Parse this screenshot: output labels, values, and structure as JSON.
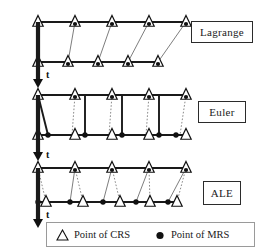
{
  "figure": {
    "title_hidden": "",
    "panels": [
      {
        "id": "lagrange",
        "label": "Lagrange",
        "time_axis_label": "t",
        "description": "Mesh points coincide with material points at all times",
        "rows": [
          {
            "name": "row-initial",
            "y": 22,
            "crs_x": [
              38,
              75,
              112,
              149,
              186
            ],
            "mrs_x": [
              38,
              75,
              112,
              149,
              186
            ],
            "coincident": true
          },
          {
            "name": "row-deformed",
            "y": 62,
            "crs_x": [
              38,
              68,
              98,
              128,
              158
            ],
            "mrs_x": [
              38,
              68,
              98,
              128,
              158
            ],
            "coincident": true
          }
        ],
        "connectors": [
          {
            "type": "thin",
            "x1": 38,
            "y1": 22,
            "x2": 38,
            "y2": 62
          },
          {
            "type": "thin",
            "x1": 75,
            "y1": 22,
            "x2": 68,
            "y2": 62
          },
          {
            "type": "thin",
            "x1": 112,
            "y1": 22,
            "x2": 98,
            "y2": 62
          },
          {
            "type": "thin",
            "x1": 149,
            "y1": 22,
            "x2": 128,
            "y2": 62
          },
          {
            "type": "thin",
            "x1": 186,
            "y1": 22,
            "x2": 158,
            "y2": 62
          }
        ]
      },
      {
        "id": "euler",
        "label": "Euler",
        "time_axis_label": "t",
        "description": "Mesh points fixed in space while material points move",
        "rows": [
          {
            "name": "row-initial",
            "y": 95,
            "crs_x": [
              38,
              75,
              112,
              149,
              186
            ],
            "mrs_x": [
              38,
              75,
              112,
              149,
              186
            ],
            "coincident": true
          },
          {
            "name": "row-deformed",
            "y": 135,
            "crs_x": [
              38,
              75,
              112,
              149,
              186
            ],
            "mrs_x": [
              48,
              85,
              122,
              159,
              176
            ],
            "coincident": false
          }
        ],
        "connectors": [
          {
            "type": "thick",
            "x1": 38,
            "y1": 95,
            "x2": 48,
            "y2": 135
          },
          {
            "type": "dotted",
            "x1": 75,
            "y1": 95,
            "x2": 72,
            "y2": 135
          },
          {
            "type": "thick",
            "x1": 85,
            "y1": 95,
            "x2": 85,
            "y2": 135
          },
          {
            "type": "dotted",
            "x1": 112,
            "y1": 95,
            "x2": 109,
            "y2": 135
          },
          {
            "type": "thick",
            "x1": 122,
            "y1": 95,
            "x2": 122,
            "y2": 135
          },
          {
            "type": "dotted",
            "x1": 149,
            "y1": 95,
            "x2": 146,
            "y2": 135
          },
          {
            "type": "thick",
            "x1": 159,
            "y1": 95,
            "x2": 159,
            "y2": 135
          },
          {
            "type": "dotted",
            "x1": 186,
            "y1": 95,
            "x2": 180,
            "y2": 135
          }
        ]
      },
      {
        "id": "ale",
        "label": "ALE",
        "time_axis_label": "t",
        "description": "Arbitrary Lagrangian-Eulerian: mesh moves independently of material",
        "rows": [
          {
            "name": "row-initial",
            "y": 168,
            "crs_x": [
              38,
              75,
              112,
              149,
              186
            ],
            "mrs_x": [
              38,
              75,
              112,
              149,
              186
            ],
            "coincident": true
          },
          {
            "name": "row-deformed",
            "y": 202,
            "crs_x": [
              46,
              83,
              120,
              150,
              177
            ],
            "mrs_x": [
              38,
              70,
              103,
              136,
              168
            ],
            "coincident": false
          }
        ],
        "connectors": [
          {
            "type": "thin",
            "x1": 38,
            "y1": 168,
            "x2": 38,
            "y2": 202
          },
          {
            "type": "dotted",
            "x1": 38,
            "y1": 168,
            "x2": 46,
            "y2": 202
          },
          {
            "type": "thin",
            "x1": 75,
            "y1": 168,
            "x2": 70,
            "y2": 202
          },
          {
            "type": "dotted",
            "x1": 75,
            "y1": 168,
            "x2": 83,
            "y2": 202
          },
          {
            "type": "thin",
            "x1": 112,
            "y1": 168,
            "x2": 103,
            "y2": 202
          },
          {
            "type": "dotted",
            "x1": 112,
            "y1": 168,
            "x2": 120,
            "y2": 202
          },
          {
            "type": "thin",
            "x1": 149,
            "y1": 168,
            "x2": 136,
            "y2": 202
          },
          {
            "type": "dotted",
            "x1": 149,
            "y1": 168,
            "x2": 150,
            "y2": 202
          },
          {
            "type": "thin",
            "x1": 186,
            "y1": 168,
            "x2": 168,
            "y2": 202
          },
          {
            "type": "dotted",
            "x1": 186,
            "y1": 168,
            "x2": 177,
            "y2": 202
          }
        ]
      }
    ],
    "legend": {
      "crs_label": "Point of CRS",
      "crs_marker": "triangle-outline-icon",
      "mrs_label": "Point of MRS",
      "mrs_marker": "filled-circle-icon"
    },
    "colors": {
      "line": "#1a1a1a",
      "thin_line": "#6e6e6e",
      "dotted_line": "#8a8a8a",
      "marker_fill": "#ffffff",
      "marker_stroke": "#111111",
      "dot_fill": "#111111",
      "box_border": "#2b2b2b",
      "legend_border": "#9a9a9a",
      "background": "#ffffff"
    }
  }
}
